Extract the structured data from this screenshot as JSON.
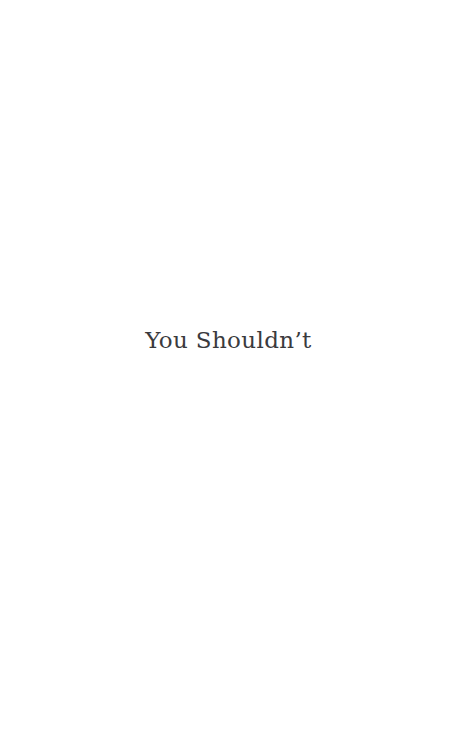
{
  "page": {
    "width": 457,
    "height": 742,
    "background_color": "#ffffff",
    "text_color": "#3a3a3d"
  },
  "document": {
    "title": "You Shouldn’t"
  }
}
